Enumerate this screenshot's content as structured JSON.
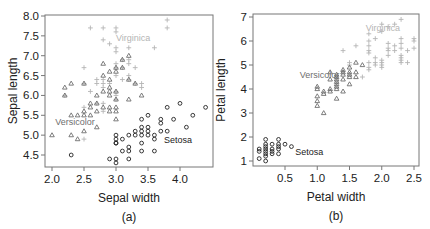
{
  "colors": {
    "setosa": "#222222",
    "versicolor": "#6e6e6e",
    "virginica": "#b4b4b4",
    "axis": "#777777",
    "text": "#222222"
  },
  "chart_data": [
    {
      "type": "scatter",
      "panel_caption": "(a)",
      "title": "",
      "xlabel": "Sepal width",
      "ylabel": "Sepal length",
      "xlim": [
        1.9,
        4.5
      ],
      "ylim": [
        4.2,
        8.05
      ],
      "xticks": [
        2.0,
        2.5,
        3.0,
        3.5,
        4.0
      ],
      "xtick_labels": [
        "2.0",
        "2.5",
        "3.0",
        "3.5",
        "4.0"
      ],
      "yticks": [
        4.5,
        5.0,
        5.5,
        6.0,
        6.5,
        7.0,
        7.5,
        8.0
      ],
      "ytick_labels": [
        "4.5",
        "5.0",
        "5.5",
        "6.0",
        "6.5",
        "7.0",
        "7.5",
        "8.0"
      ],
      "grid": false,
      "frame": {
        "left": 45,
        "top": 15,
        "right": 213,
        "bottom": 167
      },
      "pixel_map": {
        "x0": 2.0,
        "px0": 52,
        "x1": 4.0,
        "px1": 180,
        "y0": 4.5,
        "py0": 155,
        "y1": 8.0,
        "py1": 16
      },
      "annotations": [
        {
          "text": "Virginica",
          "x": 3.0,
          "y": 7.45,
          "series": "Virginica"
        },
        {
          "text": "Versicolor",
          "x": 2.05,
          "y": 5.33,
          "series": "Versicolor"
        },
        {
          "text": "Setosa",
          "x": 3.75,
          "y": 4.88,
          "series": "Setosa"
        }
      ],
      "series": [
        {
          "name": "Setosa",
          "marker": "circle",
          "points": [
            [
              2.3,
              4.5
            ],
            [
              2.9,
              4.4
            ],
            [
              3.0,
              4.4
            ],
            [
              3.0,
              4.3
            ],
            [
              3.0,
              4.8
            ],
            [
              3.0,
              4.9
            ],
            [
              3.0,
              5.0
            ],
            [
              3.0,
              4.8
            ],
            [
              3.1,
              4.6
            ],
            [
              3.1,
              4.9
            ],
            [
              3.2,
              4.4
            ],
            [
              3.2,
              4.6
            ],
            [
              3.2,
              4.7
            ],
            [
              3.2,
              5.0
            ],
            [
              3.3,
              5.0
            ],
            [
              3.3,
              5.1
            ],
            [
              3.4,
              4.6
            ],
            [
              3.4,
              4.8
            ],
            [
              3.4,
              5.0
            ],
            [
              3.4,
              5.1
            ],
            [
              3.4,
              5.2
            ],
            [
              3.4,
              5.4
            ],
            [
              3.5,
              5.0
            ],
            [
              3.5,
              5.1
            ],
            [
              3.5,
              5.2
            ],
            [
              3.5,
              5.5
            ],
            [
              3.6,
              4.6
            ],
            [
              3.6,
              4.9
            ],
            [
              3.6,
              5.0
            ],
            [
              3.7,
              5.1
            ],
            [
              3.7,
              5.3
            ],
            [
              3.7,
              5.4
            ],
            [
              3.8,
              5.1
            ],
            [
              3.8,
              5.7
            ],
            [
              3.9,
              5.4
            ],
            [
              4.0,
              5.8
            ],
            [
              4.1,
              5.2
            ],
            [
              4.2,
              5.5
            ],
            [
              4.4,
              5.7
            ]
          ]
        },
        {
          "name": "Versicolor",
          "marker": "triangle",
          "points": [
            [
              2.0,
              5.0
            ],
            [
              2.2,
              6.0
            ],
            [
              2.2,
              6.2
            ],
            [
              2.3,
              5.0
            ],
            [
              2.3,
              5.5
            ],
            [
              2.3,
              6.3
            ],
            [
              2.4,
              4.9
            ],
            [
              2.4,
              5.5
            ],
            [
              2.5,
              5.1
            ],
            [
              2.5,
              5.5
            ],
            [
              2.5,
              5.6
            ],
            [
              2.5,
              6.3
            ],
            [
              2.6,
              5.5
            ],
            [
              2.6,
              5.7
            ],
            [
              2.6,
              5.8
            ],
            [
              2.7,
              5.2
            ],
            [
              2.7,
              5.6
            ],
            [
              2.7,
              5.8
            ],
            [
              2.7,
              6.0
            ],
            [
              2.8,
              5.7
            ],
            [
              2.8,
              6.1
            ],
            [
              2.8,
              6.5
            ],
            [
              2.8,
              6.8
            ],
            [
              2.9,
              5.6
            ],
            [
              2.9,
              5.7
            ],
            [
              2.9,
              6.0
            ],
            [
              2.9,
              6.1
            ],
            [
              2.9,
              6.2
            ],
            [
              2.9,
              6.4
            ],
            [
              2.9,
              6.6
            ],
            [
              3.0,
              5.4
            ],
            [
              3.0,
              5.6
            ],
            [
              3.0,
              5.7
            ],
            [
              3.0,
              5.9
            ],
            [
              3.0,
              6.1
            ],
            [
              3.0,
              6.6
            ],
            [
              3.0,
              6.7
            ],
            [
              3.1,
              6.7
            ],
            [
              3.1,
              6.9
            ],
            [
              3.2,
              5.9
            ],
            [
              3.2,
              6.4
            ],
            [
              3.2,
              7.0
            ],
            [
              3.3,
              6.3
            ],
            [
              3.4,
              6.0
            ]
          ]
        },
        {
          "name": "Virginica",
          "marker": "plus",
          "points": [
            [
              2.2,
              6.0
            ],
            [
              2.5,
              4.9
            ],
            [
              2.5,
              5.7
            ],
            [
              2.5,
              6.3
            ],
            [
              2.5,
              6.7
            ],
            [
              2.6,
              6.1
            ],
            [
              2.6,
              7.7
            ],
            [
              2.7,
              5.8
            ],
            [
              2.7,
              6.3
            ],
            [
              2.7,
              6.4
            ],
            [
              2.8,
              5.6
            ],
            [
              2.8,
              5.8
            ],
            [
              2.8,
              6.2
            ],
            [
              2.8,
              6.3
            ],
            [
              2.8,
              6.4
            ],
            [
              2.8,
              7.4
            ],
            [
              2.8,
              7.7
            ],
            [
              2.9,
              6.3
            ],
            [
              2.9,
              7.3
            ],
            [
              3.0,
              5.9
            ],
            [
              3.0,
              6.0
            ],
            [
              3.0,
              6.1
            ],
            [
              3.0,
              6.5
            ],
            [
              3.0,
              6.7
            ],
            [
              3.0,
              6.8
            ],
            [
              3.0,
              7.1
            ],
            [
              3.0,
              7.2
            ],
            [
              3.0,
              7.6
            ],
            [
              3.0,
              7.7
            ],
            [
              3.1,
              6.4
            ],
            [
              3.1,
              6.7
            ],
            [
              3.1,
              6.9
            ],
            [
              3.2,
              6.4
            ],
            [
              3.2,
              6.5
            ],
            [
              3.2,
              6.8
            ],
            [
              3.2,
              6.9
            ],
            [
              3.2,
              7.2
            ],
            [
              3.3,
              6.3
            ],
            [
              3.3,
              6.7
            ],
            [
              3.4,
              6.2
            ],
            [
              3.4,
              6.3
            ],
            [
              3.6,
              7.2
            ],
            [
              3.8,
              7.7
            ],
            [
              3.8,
              7.9
            ]
          ]
        }
      ]
    },
    {
      "type": "scatter",
      "panel_caption": "(b)",
      "title": "",
      "xlabel": "Petal width",
      "ylabel": "Petal length",
      "xlim": [
        0.0,
        2.6
      ],
      "ylim": [
        0.8,
        7.1
      ],
      "xticks": [
        0.5,
        1.0,
        1.5,
        2.0,
        2.5
      ],
      "xtick_labels": [
        "0.5",
        "1.0",
        "1.5",
        "2.0",
        "2.5"
      ],
      "yticks": [
        1,
        2,
        3,
        4,
        5,
        6,
        7
      ],
      "ytick_labels": [
        "1",
        "2",
        "3",
        "4",
        "5",
        "6",
        "7"
      ],
      "grid": false,
      "frame": {
        "left": 253,
        "top": 14,
        "right": 419,
        "bottom": 166
      },
      "pixel_map": {
        "x0": 0.5,
        "px0": 285,
        "x1": 2.5,
        "px1": 414,
        "y0": 1,
        "py0": 161,
        "y1": 7,
        "py1": 17
      },
      "annotations": [
        {
          "text": "Virginica",
          "x": 1.75,
          "y": 6.55,
          "series": "Virginica"
        },
        {
          "text": "Versicolor",
          "x": 0.73,
          "y": 4.6,
          "series": "Versicolor"
        },
        {
          "text": "Setosa",
          "x": 0.66,
          "y": 1.38,
          "series": "Setosa"
        }
      ],
      "series": [
        {
          "name": "Setosa",
          "marker": "circle",
          "points": [
            [
              0.1,
              1.1
            ],
            [
              0.1,
              1.4
            ],
            [
              0.1,
              1.5
            ],
            [
              0.2,
              1.0
            ],
            [
              0.2,
              1.2
            ],
            [
              0.2,
              1.3
            ],
            [
              0.2,
              1.4
            ],
            [
              0.2,
              1.5
            ],
            [
              0.2,
              1.6
            ],
            [
              0.2,
              1.7
            ],
            [
              0.2,
              1.9
            ],
            [
              0.3,
              1.3
            ],
            [
              0.3,
              1.4
            ],
            [
              0.3,
              1.5
            ],
            [
              0.3,
              1.7
            ],
            [
              0.4,
              1.3
            ],
            [
              0.4,
              1.5
            ],
            [
              0.4,
              1.6
            ],
            [
              0.4,
              1.7
            ],
            [
              0.4,
              1.9
            ],
            [
              0.5,
              1.7
            ],
            [
              0.6,
              1.6
            ]
          ]
        },
        {
          "name": "Versicolor",
          "marker": "triangle",
          "points": [
            [
              1.0,
              3.3
            ],
            [
              1.0,
              3.5
            ],
            [
              1.0,
              3.7
            ],
            [
              1.0,
              4.0
            ],
            [
              1.0,
              4.1
            ],
            [
              1.1,
              3.0
            ],
            [
              1.1,
              3.8
            ],
            [
              1.1,
              3.9
            ],
            [
              1.2,
              3.9
            ],
            [
              1.2,
              4.0
            ],
            [
              1.2,
              4.4
            ],
            [
              1.2,
              4.7
            ],
            [
              1.3,
              3.6
            ],
            [
              1.3,
              4.0
            ],
            [
              1.3,
              4.1
            ],
            [
              1.3,
              4.2
            ],
            [
              1.3,
              4.3
            ],
            [
              1.3,
              4.4
            ],
            [
              1.3,
              4.5
            ],
            [
              1.3,
              4.6
            ],
            [
              1.4,
              3.9
            ],
            [
              1.4,
              4.4
            ],
            [
              1.4,
              4.6
            ],
            [
              1.4,
              4.7
            ],
            [
              1.4,
              4.8
            ],
            [
              1.5,
              4.2
            ],
            [
              1.5,
              4.5
            ],
            [
              1.5,
              4.6
            ],
            [
              1.5,
              4.7
            ],
            [
              1.5,
              4.9
            ],
            [
              1.6,
              4.5
            ],
            [
              1.6,
              4.7
            ],
            [
              1.6,
              5.1
            ],
            [
              1.7,
              5.0
            ]
          ]
        },
        {
          "name": "Virginica",
          "marker": "plus",
          "points": [
            [
              1.4,
              5.6
            ],
            [
              1.5,
              5.0
            ],
            [
              1.5,
              5.1
            ],
            [
              1.6,
              5.8
            ],
            [
              1.7,
              4.5
            ],
            [
              1.8,
              4.8
            ],
            [
              1.8,
              4.9
            ],
            [
              1.8,
              5.1
            ],
            [
              1.8,
              5.5
            ],
            [
              1.8,
              5.6
            ],
            [
              1.8,
              5.8
            ],
            [
              1.8,
              6.0
            ],
            [
              1.8,
              6.3
            ],
            [
              1.9,
              5.0
            ],
            [
              1.9,
              5.1
            ],
            [
              1.9,
              5.3
            ],
            [
              1.9,
              6.1
            ],
            [
              2.0,
              4.9
            ],
            [
              2.0,
              5.0
            ],
            [
              2.0,
              5.1
            ],
            [
              2.0,
              5.2
            ],
            [
              2.0,
              6.4
            ],
            [
              2.0,
              6.7
            ],
            [
              2.1,
              5.4
            ],
            [
              2.1,
              5.6
            ],
            [
              2.1,
              5.7
            ],
            [
              2.1,
              5.9
            ],
            [
              2.1,
              6.6
            ],
            [
              2.2,
              5.6
            ],
            [
              2.2,
              5.8
            ],
            [
              2.2,
              6.7
            ],
            [
              2.3,
              5.1
            ],
            [
              2.3,
              5.2
            ],
            [
              2.3,
              5.3
            ],
            [
              2.3,
              5.4
            ],
            [
              2.3,
              5.7
            ],
            [
              2.3,
              5.9
            ],
            [
              2.3,
              6.1
            ],
            [
              2.3,
              6.9
            ],
            [
              2.4,
              5.1
            ],
            [
              2.4,
              5.6
            ],
            [
              2.5,
              5.7
            ],
            [
              2.5,
              6.0
            ],
            [
              2.5,
              6.1
            ]
          ]
        }
      ]
    }
  ]
}
